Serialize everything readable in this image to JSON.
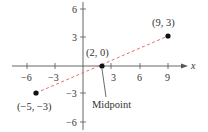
{
  "diagram": {
    "type": "coordinate-plane-midpoint",
    "axes": {
      "x_label": "x",
      "x_ticks": [
        {
          "value": -6,
          "label": "−6"
        },
        {
          "value": -3,
          "label": "−3"
        },
        {
          "value": 3,
          "label": "3"
        },
        {
          "value": 6,
          "label": "6"
        },
        {
          "value": 9,
          "label": "9"
        }
      ],
      "y_ticks": [
        {
          "value": 6,
          "label": "6"
        },
        {
          "value": 3,
          "label": "3"
        },
        {
          "value": -3,
          "label": "−3"
        },
        {
          "value": -6,
          "label": "−6"
        }
      ]
    },
    "points": [
      {
        "x": -5,
        "y": -3,
        "label": "(−5, −3)"
      },
      {
        "x": 2,
        "y": 0,
        "label": "(2, 0)"
      },
      {
        "x": 9,
        "y": 3,
        "label": "(9, 3)"
      }
    ],
    "segment": {
      "from": [
        -5,
        -3
      ],
      "to": [
        9,
        3
      ],
      "style": "dashed",
      "color": "#e0706f"
    },
    "annotation": {
      "label": "Midpoint",
      "points_to": [
        2,
        0
      ]
    },
    "colors": {
      "axis": "#555555",
      "point": "#111111",
      "segment": "#e0706f",
      "text": "#333333"
    }
  }
}
